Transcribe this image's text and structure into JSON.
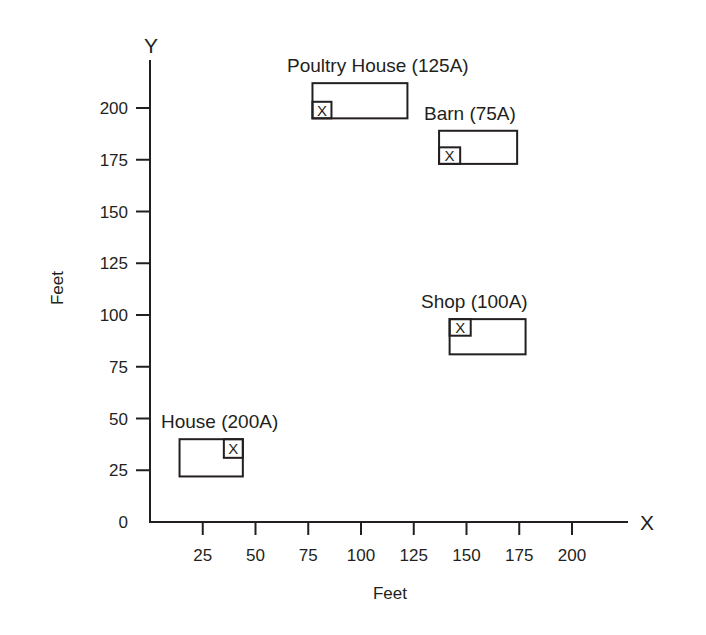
{
  "chart_data": {
    "type": "scatter",
    "title": "",
    "xlabel": "Feet",
    "ylabel": "Feet",
    "x_axis_letter": "X",
    "y_axis_letter": "Y",
    "xlim": [
      0,
      225
    ],
    "ylim": [
      0,
      215
    ],
    "x_ticks": [
      25,
      50,
      75,
      100,
      125,
      150,
      175,
      200
    ],
    "y_ticks": [
      0,
      25,
      50,
      75,
      100,
      125,
      150,
      175,
      200
    ],
    "grid": false,
    "buildings": [
      {
        "name": "House",
        "load": "200A",
        "label": "House (200A)",
        "x": [
          14,
          44
        ],
        "y": [
          22,
          40
        ],
        "service_x": [
          35,
          44
        ],
        "service_y": [
          31,
          40
        ],
        "service_mark": "X"
      },
      {
        "name": "Poultry House",
        "load": "125A",
        "label": "Poultry House (125A)",
        "x": [
          77,
          122
        ],
        "y": [
          195,
          212
        ],
        "service_x": [
          77,
          86
        ],
        "service_y": [
          195,
          203
        ],
        "service_mark": "X"
      },
      {
        "name": "Barn",
        "load": "75A",
        "label": "Barn (75A)",
        "x": [
          137,
          174
        ],
        "y": [
          173,
          189
        ],
        "service_x": [
          137,
          147
        ],
        "service_y": [
          173,
          181
        ],
        "service_mark": "X"
      },
      {
        "name": "Shop",
        "load": "100A",
        "label": "Shop (100A)",
        "x": [
          142,
          178
        ],
        "y": [
          81,
          98
        ],
        "service_x": [
          142,
          152
        ],
        "service_y": [
          90,
          98
        ],
        "service_mark": "X"
      }
    ]
  }
}
